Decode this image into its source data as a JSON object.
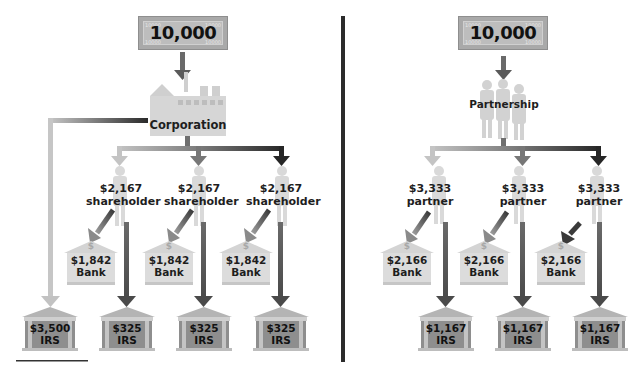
{
  "corporation": {
    "income": "10,000",
    "entity_label": "Corporation",
    "corporate_tax": {
      "amount": "$3,500",
      "label": "IRS"
    },
    "shareholders": [
      {
        "amount": "$2,167",
        "role": "shareholder",
        "bank": {
          "amount": "$1,842",
          "label": "Bank"
        },
        "tax": {
          "amount": "$325",
          "label": "IRS"
        }
      },
      {
        "amount": "$2,167",
        "role": "shareholder",
        "bank": {
          "amount": "$1,842",
          "label": "Bank"
        },
        "tax": {
          "amount": "$325",
          "label": "IRS"
        }
      },
      {
        "amount": "$2,167",
        "role": "shareholder",
        "bank": {
          "amount": "$1,842",
          "label": "Bank"
        },
        "tax": {
          "amount": "$325",
          "label": "IRS"
        }
      }
    ]
  },
  "partnership": {
    "income": "10,000",
    "entity_label": "Partnership",
    "partners": [
      {
        "amount": "$3,333",
        "role": "partner",
        "bank": {
          "amount": "$2,166",
          "label": "Bank"
        },
        "tax": {
          "amount": "$1,167",
          "label": "IRS"
        }
      },
      {
        "amount": "$3,333",
        "role": "partner",
        "bank": {
          "amount": "$2,166",
          "label": "Bank"
        },
        "tax": {
          "amount": "$1,167",
          "label": "IRS"
        }
      },
      {
        "amount": "$3,333",
        "role": "partner",
        "bank": {
          "amount": "$2,166",
          "label": "Bank"
        },
        "tax": {
          "amount": "$1,167",
          "label": "IRS"
        }
      }
    ]
  },
  "bill_ornament": "10000",
  "bank_symbol": "$",
  "colors": {
    "arrow_light": "#b9b9b9",
    "arrow_mid": "#6f6f6f",
    "arrow_dark": "#2a2a2a",
    "divider": "#2b2b2b",
    "bill": "#a9a9a9",
    "building_light": "#dcdcdc",
    "irs_body": "#8e8e8e"
  }
}
